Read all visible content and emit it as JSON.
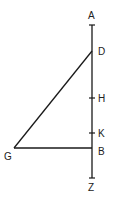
{
  "diagram": {
    "type": "geometric-figure",
    "stroke_color": "#1a1a1a",
    "points": {
      "A": {
        "label": "A",
        "x": 92,
        "y": 25
      },
      "D": {
        "label": "D",
        "x": 92,
        "y": 51
      },
      "H": {
        "label": "H",
        "x": 92,
        "y": 98
      },
      "K": {
        "label": "K",
        "x": 92,
        "y": 133
      },
      "B": {
        "label": "B",
        "x": 92,
        "y": 148
      },
      "G": {
        "label": "G",
        "x": 14,
        "y": 148
      },
      "Z": {
        "label": "Z",
        "x": 92,
        "y": 178
      }
    },
    "segments": [
      {
        "from": "A",
        "to": "Z"
      },
      {
        "from": "D",
        "to": "G"
      },
      {
        "from": "G",
        "to": "B"
      }
    ]
  }
}
